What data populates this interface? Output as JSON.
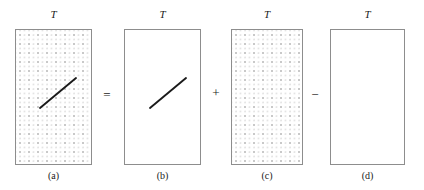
{
  "figure": {
    "background_color": "#ffffff",
    "rect_border_color": "#8d8d8d",
    "dot_color": "#c9c9c9",
    "line_color": "#1a1a1a",
    "panels": [
      {
        "id": "a",
        "title": "T",
        "caption": "(a)",
        "dotted": true,
        "has_diagonal": true,
        "x": 15,
        "y": 29,
        "w": 77,
        "h": 136,
        "line": {
          "x1": 40,
          "y1": 108,
          "x2": 76,
          "y2": 78
        }
      },
      {
        "id": "b",
        "title": "T",
        "caption": "(b)",
        "dotted": false,
        "has_diagonal": true,
        "x": 124,
        "y": 29,
        "w": 77,
        "h": 136,
        "line": {
          "x1": 150,
          "y1": 108,
          "x2": 186,
          "y2": 78
        }
      },
      {
        "id": "c",
        "title": "T",
        "caption": "(c)",
        "dotted": true,
        "has_diagonal": false,
        "x": 231,
        "y": 29,
        "w": 72,
        "h": 136,
        "line": null
      },
      {
        "id": "d",
        "title": "T",
        "caption": "(d)",
        "dotted": false,
        "has_diagonal": false,
        "x": 330,
        "y": 29,
        "w": 75,
        "h": 136,
        "line": null
      }
    ],
    "operators": [
      {
        "id": "equals",
        "symbol": "=",
        "x": 100,
        "y": 88
      },
      {
        "id": "plus",
        "symbol": "+",
        "x": 210,
        "y": 87
      },
      {
        "id": "minus",
        "symbol": "−",
        "x": 309,
        "y": 88
      }
    ]
  }
}
